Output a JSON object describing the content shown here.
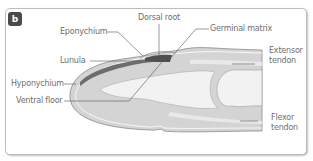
{
  "panel": {
    "letter": "b"
  },
  "labels": {
    "eponychium": "Eponychium",
    "dorsal_root": "Dorsal root",
    "germinal_matrix": "Germinal matrix",
    "lunula": "Lunula",
    "hyponychium": "Hyponychium",
    "ventral_floor": "Ventral floor",
    "extensor_line1": "Extensor",
    "extensor_line2": "tendon",
    "flexor_line1": "Flexor",
    "flexor_line2": "tendon"
  },
  "colors": {
    "soft_tissue": "#d4d4d4",
    "bone": "#f2f2f2",
    "nail": "#6d6d6d",
    "outline": "#8a8a8a",
    "label_text": "#6f6f6f",
    "badge_bg": "#4a4a4a"
  }
}
